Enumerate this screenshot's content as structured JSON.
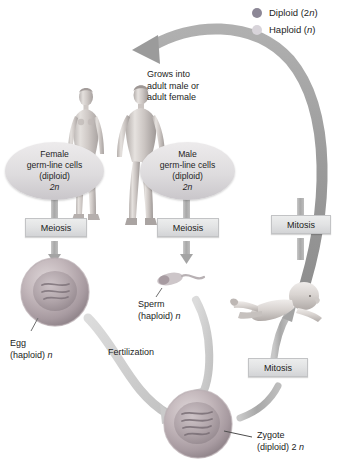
{
  "diagram": {
    "legend": {
      "items": [
        {
          "label": "Diploid (2",
          "italic": "n",
          "tail": ")",
          "full": "Diploid (2n)",
          "color": "#8c8796",
          "name": "diploid"
        },
        {
          "label": "Haploid (",
          "italic": "n",
          "tail": ")",
          "full": "Haploid (n)",
          "color": "#d6d2d8",
          "name": "haploid"
        }
      ]
    },
    "callouts": {
      "female_germline": {
        "line1": "Female",
        "line2": "germ-line cells",
        "line3": "(diploid)",
        "line4": "2n",
        "ploidy": "2n"
      },
      "male_germline": {
        "line1": "Male",
        "line2": "germ-line cells",
        "line3": "(diploid)",
        "line4": "2n",
        "ploidy": "2n"
      }
    },
    "process_boxes": {
      "meiosis_female": "Meiosis",
      "meiosis_male": "Meiosis",
      "mitosis_right": "Mitosis",
      "mitosis_lower": "Mitosis"
    },
    "annotations": {
      "grows_into": {
        "line1": "Grows into",
        "line2": "adult male or",
        "line3": "adult female"
      },
      "egg": {
        "line1": "Egg",
        "line2": "(haploid)",
        "italic": "n"
      },
      "sperm": {
        "line1": "Sperm",
        "line2": "(haploid)",
        "italic": "n"
      },
      "fertilization": {
        "line1": "Fertilization"
      },
      "zygote": {
        "line1": "Zygote",
        "line2": "(diploid) 2",
        "italic": "n"
      }
    },
    "figures": {
      "female_adult": "adult-female-body",
      "male_adult": "adult-male-body",
      "baby": "infant-body",
      "egg_cell": "egg-cell",
      "sperm_cell": "sperm-cell",
      "zygote_cell": "zygote-cell"
    },
    "colors": {
      "arrow_gray": "#9a9a9a",
      "arrow_light": "#c9c9c9",
      "cell_membrane": "#b5a9ae",
      "cell_nucleus": "#9d9098",
      "box_fill": "#e4e5e6",
      "text": "#1c1c1c"
    }
  }
}
